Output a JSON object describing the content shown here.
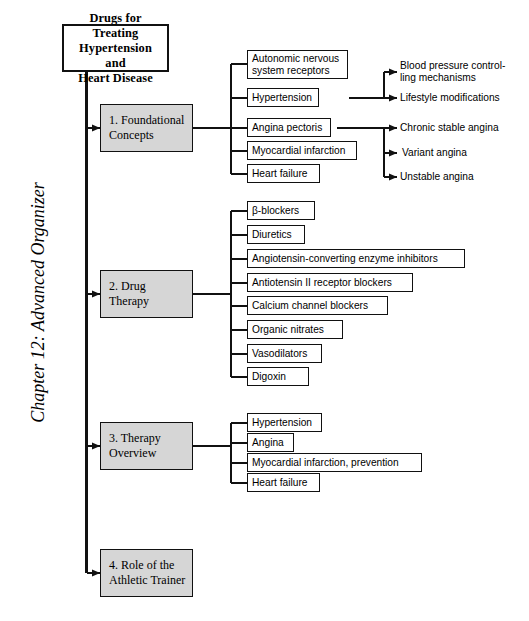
{
  "page": {
    "chapter_label": "Chapter 12: Advanced Organizer",
    "ink_color": "#111111",
    "shaded_fill": "#d6d6d6",
    "background": "#ffffff"
  },
  "root": {
    "title": "Drugs for Treating\nHypertension and\nHeart Disease"
  },
  "sections": [
    {
      "id": "foundational-concepts",
      "label": "1.  Foundational\n     Concepts",
      "children": [
        {
          "label": "Autonomic nervous\nsystem receptors",
          "leaves": []
        },
        {
          "label": "Hypertension",
          "leaves": [
            "Blood pressure control-\nling mechanisms",
            "Lifestyle modifications"
          ]
        },
        {
          "label": "Angina pectoris",
          "leaves": [
            "Chronic stable angina",
            "Variant angina",
            "Unstable angina"
          ]
        },
        {
          "label": "Myocardial infarction",
          "leaves": []
        },
        {
          "label": "Heart failure",
          "leaves": []
        }
      ]
    },
    {
      "id": "drug-therapy",
      "label": "2.  Drug Therapy",
      "children": [
        {
          "label": "β-blockers",
          "leaves": []
        },
        {
          "label": "Diuretics",
          "leaves": []
        },
        {
          "label": "Angiotensin-converting enzyme inhibitors",
          "leaves": []
        },
        {
          "label": "Antiotensin II receptor blockers",
          "leaves": []
        },
        {
          "label": "Calcium channel blockers",
          "leaves": []
        },
        {
          "label": "Organic nitrates",
          "leaves": []
        },
        {
          "label": "Vasodilators",
          "leaves": []
        },
        {
          "label": "Digoxin",
          "leaves": []
        }
      ]
    },
    {
      "id": "therapy-overview",
      "label": "3.  Therapy\n     Overview",
      "children": [
        {
          "label": "Hypertension",
          "leaves": []
        },
        {
          "label": "Angina",
          "leaves": []
        },
        {
          "label": "Myocardial infarction, prevention",
          "leaves": []
        },
        {
          "label": "Heart failure",
          "leaves": []
        }
      ]
    },
    {
      "id": "role-athletic-trainer",
      "label": "4.  Role of the\n     Athletic Trainer",
      "children": []
    }
  ]
}
